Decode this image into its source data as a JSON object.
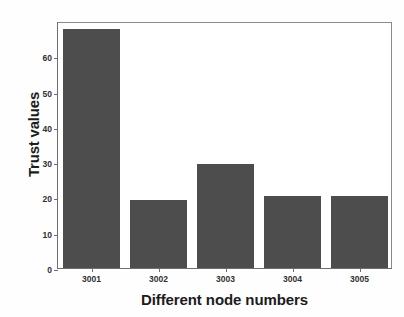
{
  "chart_data": {
    "type": "bar",
    "title": "",
    "subtitle": "",
    "xlabel": "Different node numbers",
    "ylabel": "Trust values",
    "categories": [
      "3001",
      "3002",
      "3003",
      "3004",
      "3005"
    ],
    "values": [
      67.7,
      19.2,
      29.4,
      20.3,
      20.4
    ],
    "series": [
      {
        "name": "Trust values",
        "values": [
          67.7,
          19.2,
          29.4,
          20.3,
          20.4
        ]
      }
    ],
    "xlim": [
      0,
      5
    ],
    "ylim": [
      0,
      70
    ],
    "ytick_labels": [
      "0",
      "10",
      "20",
      "30",
      "40",
      "50",
      "60"
    ],
    "ytick_values": [
      0,
      10,
      20,
      30,
      40,
      50,
      60
    ],
    "xtick_labels": [
      "3001",
      "3002",
      "3003",
      "3004",
      "3005"
    ],
    "grid": false,
    "legend": false,
    "legend_position": "none",
    "bar_color": "#4d4d4d",
    "axis_color": "#6e6e6e",
    "text_color": "#1c1c1c",
    "background_color": "#ffffff"
  }
}
